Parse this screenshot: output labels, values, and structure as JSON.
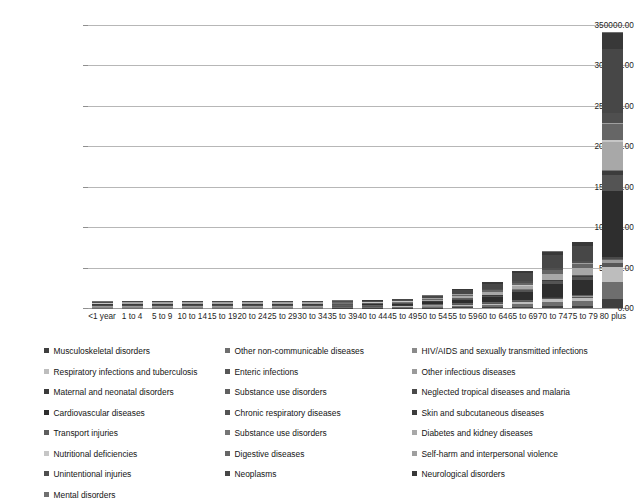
{
  "chart_data": {
    "type": "bar",
    "stacked": true,
    "title": "",
    "xlabel": "",
    "ylabel": "",
    "ylim": [
      0,
      350000
    ],
    "yticks": [
      0,
      50000,
      100000,
      150000,
      200000,
      250000,
      300000,
      350000
    ],
    "ytick_labels": [
      "0.00",
      "50000.00",
      "100000.00",
      "150000.00",
      "200000.00",
      "250000.00",
      "300000.00",
      "350000.00"
    ],
    "grid": true,
    "legend_position": "bottom",
    "categories": [
      "<1 year",
      "1 to 4",
      "5 to 9",
      "10 to 14",
      "15 to 19",
      "20 to 24",
      "25 to 29",
      "30 to 34",
      "35 to 39",
      "40 to 44",
      "45 to 49",
      "50 to 54",
      "55 to 59",
      "60 to 64",
      "65 to 69",
      "70 to 74",
      "75 to 79",
      "80 plus"
    ],
    "totals": [
      3100,
      1500,
      900,
      1100,
      1400,
      1500,
      2100,
      2900,
      3600,
      5500,
      8200,
      13000,
      21000,
      30000,
      44000,
      68000,
      80000,
      340000
    ],
    "series": [
      {
        "name": "Musculoskeletal disorders",
        "color": "#3f3f3f",
        "values": [
          0,
          0,
          0,
          0,
          0,
          0,
          0,
          0,
          100,
          150,
          250,
          400,
          600,
          900,
          1300,
          1900,
          2300,
          9000
        ]
      },
      {
        "name": "Other non-communicable diseases",
        "color": "#6e6e6e",
        "values": [
          400,
          200,
          100,
          100,
          150,
          150,
          200,
          300,
          350,
          500,
          700,
          1000,
          1500,
          2000,
          2800,
          4000,
          4600,
          18000
        ]
      },
      {
        "name": "HIV/AIDS and sexually transmitted infections",
        "color": "#8a8a8a",
        "values": [
          50,
          40,
          20,
          20,
          40,
          60,
          100,
          140,
          170,
          200,
          220,
          240,
          230,
          200,
          170,
          140,
          110,
          300
        ]
      },
      {
        "name": "Respiratory infections and tuberculosis",
        "color": "#bdbdbd",
        "values": [
          500,
          200,
          80,
          70,
          90,
          110,
          160,
          220,
          280,
          380,
          520,
          750,
          1100,
          1500,
          2100,
          3100,
          3700,
          16000
        ]
      },
      {
        "name": "Enteric infections",
        "color": "#575757",
        "values": [
          300,
          120,
          50,
          40,
          40,
          50,
          60,
          80,
          100,
          130,
          170,
          230,
          320,
          430,
          600,
          880,
          1050,
          4500
        ]
      },
      {
        "name": "Other infectious diseases",
        "color": "#9a9a9a",
        "values": [
          120,
          60,
          30,
          25,
          30,
          35,
          45,
          60,
          75,
          95,
          120,
          160,
          220,
          290,
          400,
          580,
          700,
          3000
        ]
      },
      {
        "name": "Maternal and neonatal disorders",
        "color": "#3a3a3a",
        "values": [
          700,
          40,
          10,
          10,
          30,
          60,
          90,
          90,
          60,
          30,
          15,
          10,
          5,
          5,
          5,
          5,
          5,
          10
        ]
      },
      {
        "name": "Substance use disorders",
        "color": "#606060",
        "values": [
          0,
          10,
          20,
          40,
          90,
          130,
          170,
          200,
          220,
          230,
          220,
          200,
          170,
          140,
          110,
          90,
          70,
          150
        ]
      },
      {
        "name": "Neglected tropical diseases and malaria",
        "color": "#4a4a4a",
        "values": [
          80,
          50,
          30,
          25,
          25,
          30,
          35,
          45,
          55,
          70,
          90,
          120,
          160,
          210,
          290,
          420,
          500,
          2100
        ]
      },
      {
        "name": "Cardiovascular diseases",
        "color": "#2e2e2e",
        "values": [
          80,
          40,
          30,
          40,
          70,
          110,
          180,
          300,
          480,
          800,
          1300,
          2200,
          3700,
          5500,
          8200,
          13000,
          15500,
          70000
        ]
      },
      {
        "name": "Chronic respiratory diseases",
        "color": "#545454",
        "values": [
          60,
          40,
          40,
          45,
          50,
          60,
          80,
          110,
          160,
          240,
          380,
          600,
          950,
          1400,
          2100,
          3200,
          3800,
          16500
        ]
      },
      {
        "name": "Skin and subcutaneous diseases",
        "color": "#3c3c3c",
        "values": [
          40,
          30,
          25,
          30,
          40,
          50,
          60,
          80,
          100,
          130,
          170,
          230,
          320,
          430,
          600,
          880,
          1050,
          4500
        ]
      },
      {
        "name": "Transport injuries",
        "color": "#5e5e5e",
        "values": [
          60,
          70,
          60,
          70,
          160,
          220,
          230,
          220,
          200,
          190,
          180,
          170,
          160,
          150,
          140,
          140,
          130,
          400
        ]
      },
      {
        "name": "Substance use disorders",
        "color": "#757575",
        "values": [
          0,
          10,
          15,
          30,
          70,
          110,
          150,
          180,
          200,
          210,
          200,
          180,
          150,
          120,
          95,
          75,
          60,
          130
        ]
      },
      {
        "name": "Diabetes and kidney diseases",
        "color": "#a8a8a8",
        "values": [
          60,
          40,
          30,
          35,
          50,
          70,
          110,
          170,
          260,
          420,
          680,
          1100,
          1800,
          2700,
          4000,
          6100,
          7200,
          30000
        ]
      },
      {
        "name": "Nutritional deficiencies",
        "color": "#c6c6c6",
        "values": [
          150,
          60,
          25,
          20,
          20,
          25,
          30,
          40,
          50,
          65,
          85,
          115,
          160,
          210,
          290,
          430,
          510,
          2200
        ]
      },
      {
        "name": "Digestive diseases",
        "color": "#666666",
        "values": [
          70,
          50,
          35,
          40,
          60,
          90,
          130,
          190,
          270,
          390,
          560,
          820,
          1200,
          1700,
          2400,
          3500,
          4100,
          17000
        ]
      },
      {
        "name": "Self-harm and interpersonal violence",
        "color": "#9f9f9f",
        "values": [
          20,
          20,
          20,
          50,
          140,
          200,
          220,
          220,
          210,
          200,
          190,
          180,
          160,
          140,
          120,
          110,
          95,
          250
        ]
      },
      {
        "name": "Unintentional injuries",
        "color": "#4f4f4f",
        "values": [
          180,
          120,
          100,
          90,
          110,
          130,
          160,
          190,
          230,
          290,
          380,
          520,
          740,
          1050,
          1500,
          2200,
          2650,
          11000
        ]
      },
      {
        "name": "Neoplasms",
        "color": "#474747",
        "values": [
          50,
          60,
          50,
          60,
          90,
          140,
          220,
          350,
          560,
          900,
          1450,
          2400,
          3900,
          5900,
          8800,
          13500,
          16000,
          68000
        ]
      },
      {
        "name": "Neurological disorders",
        "color": "#383838",
        "values": [
          50,
          40,
          30,
          35,
          45,
          60,
          85,
          120,
          180,
          270,
          420,
          650,
          1000,
          1500,
          2200,
          3400,
          4000,
          17000
        ]
      },
      {
        "name": "Mental disorders",
        "color": "#707070",
        "values": [
          30,
          30,
          40,
          60,
          110,
          160,
          200,
          230,
          250,
          260,
          250,
          230,
          200,
          170,
          140,
          120,
          100,
          300
        ]
      }
    ]
  },
  "legend": {
    "columns": [
      [
        {
          "label": "Musculoskeletal disorders",
          "swatch": "#3f3f3f"
        },
        {
          "label": "Respiratory infections and tuberculosis",
          "swatch": "#bdbdbd"
        },
        {
          "label": "Maternal and neonatal disorders",
          "swatch": "#3a3a3a"
        },
        {
          "label": "Cardiovascular diseases",
          "swatch": "#2e2e2e"
        },
        {
          "label": "Transport injuries",
          "swatch": "#5e5e5e"
        },
        {
          "label": "Nutritional deficiencies",
          "swatch": "#c6c6c6"
        },
        {
          "label": "Unintentional injuries",
          "swatch": "#4f4f4f"
        },
        {
          "label": "Mental disorders",
          "swatch": "#707070"
        }
      ],
      [
        {
          "label": "Other non-communicable diseases",
          "swatch": "#6e6e6e"
        },
        {
          "label": "Enteric infections",
          "swatch": "#575757"
        },
        {
          "label": "Substance use disorders",
          "swatch": "#606060"
        },
        {
          "label": "Chronic respiratory diseases",
          "swatch": "#545454"
        },
        {
          "label": "Substance use disorders",
          "swatch": "#757575"
        },
        {
          "label": "Digestive diseases",
          "swatch": "#666666"
        },
        {
          "label": "Neoplasms",
          "swatch": "#474747"
        }
      ],
      [
        {
          "label": "HIV/AIDS and sexually transmitted infections",
          "swatch": "#8a8a8a"
        },
        {
          "label": "Other infectious diseases",
          "swatch": "#9a9a9a"
        },
        {
          "label": "Neglected tropical diseases and malaria",
          "swatch": "#4a4a4a"
        },
        {
          "label": "Skin and subcutaneous diseases",
          "swatch": "#3c3c3c"
        },
        {
          "label": "Diabetes and kidney diseases",
          "swatch": "#a8a8a8"
        },
        {
          "label": "Self-harm and interpersonal violence",
          "swatch": "#9f9f9f"
        },
        {
          "label": "Neurological disorders",
          "swatch": "#383838"
        }
      ]
    ]
  }
}
